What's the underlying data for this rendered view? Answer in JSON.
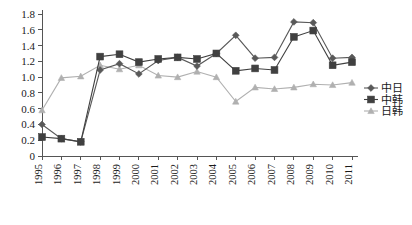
{
  "chart_data": {
    "type": "line",
    "title": "",
    "subtitle": "",
    "xlabel": "",
    "ylabel": "",
    "categories": [
      "1995",
      "1996",
      "1997",
      "1998",
      "1999",
      "2000",
      "2001",
      "2002",
      "2003",
      "2004",
      "2005",
      "2006",
      "2007",
      "2008",
      "2009",
      "2010",
      "2011"
    ],
    "ylim": [
      0,
      1.8
    ],
    "yticks": [
      "0",
      "0.2",
      "0.4",
      "0.6",
      "0.8",
      "1.0",
      "1.2",
      "1.4",
      "1.6",
      "1.8"
    ],
    "ytick_values": [
      0,
      0.2,
      0.4,
      0.6,
      0.8,
      1.0,
      1.2,
      1.4,
      1.6,
      1.8
    ],
    "grid": false,
    "legend_position": "right",
    "series": [
      {
        "name": "中日",
        "marker": "diamond",
        "color": "#595959",
        "values": [
          0.4,
          0.22,
          0.18,
          1.09,
          1.17,
          1.04,
          1.21,
          1.25,
          1.14,
          1.3,
          1.53,
          1.24,
          1.25,
          1.7,
          1.69,
          1.24,
          1.25
        ]
      },
      {
        "name": "中韩",
        "marker": "square",
        "color": "#404040",
        "values": [
          0.24,
          0.22,
          0.18,
          1.26,
          1.29,
          1.19,
          1.23,
          1.25,
          1.23,
          1.3,
          1.08,
          1.11,
          1.09,
          1.51,
          1.59,
          1.15,
          1.19
        ]
      },
      {
        "name": "日韩",
        "marker": "triangle",
        "color": "#b0b0b0",
        "values": [
          0.58,
          0.99,
          1.01,
          1.15,
          1.1,
          1.15,
          1.02,
          1.0,
          1.07,
          1.0,
          0.69,
          0.87,
          0.85,
          0.87,
          0.91,
          0.9,
          0.93
        ]
      }
    ]
  },
  "legend": {
    "items": [
      {
        "label": "中日"
      },
      {
        "label": "中韩"
      },
      {
        "label": "日韩"
      }
    ]
  },
  "colors": {
    "axis": "#555555",
    "text": "#1a1a1a",
    "series_1": "#595959",
    "series_2": "#404040",
    "series_3": "#b0b0b0",
    "background": "#ffffff"
  }
}
